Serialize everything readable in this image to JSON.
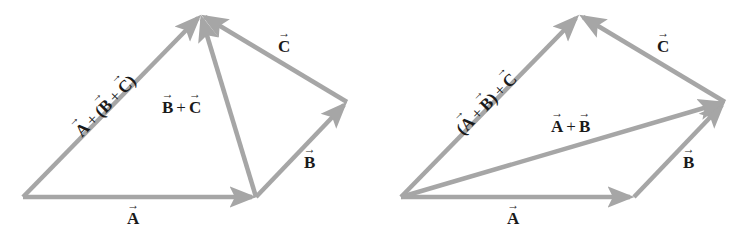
{
  "figure": {
    "left_panel": {
      "title": "A + (B + C)",
      "vectors": [
        {
          "id": "A",
          "from": [
            23,
            197
          ],
          "to": [
            256,
            197
          ]
        },
        {
          "id": "B",
          "from": [
            256,
            197
          ],
          "to": [
            347,
            102
          ]
        },
        {
          "id": "C",
          "from": [
            347,
            102
          ],
          "to": [
            201,
            15
          ]
        },
        {
          "id": "B+C",
          "from": [
            256,
            197
          ],
          "to": [
            201,
            15
          ]
        },
        {
          "id": "A+(B+C)",
          "from": [
            23,
            197
          ],
          "to": [
            201,
            15
          ]
        }
      ],
      "labels": {
        "A": "A",
        "B": "B",
        "C": "C",
        "bc_b": "B",
        "bc_plus": "+",
        "bc_c": "C",
        "sum_a": "A",
        "sum_plus1": "+",
        "sum_open": "(",
        "sum_b": "B",
        "sum_plus2": "+",
        "sum_c": "C",
        "sum_close": ")"
      }
    },
    "right_panel": {
      "title": "(A + B) + C",
      "vectors": [
        {
          "id": "A",
          "from": [
            401,
            197
          ],
          "to": [
            634,
            197
          ]
        },
        {
          "id": "B",
          "from": [
            634,
            197
          ],
          "to": [
            725,
            102
          ]
        },
        {
          "id": "C",
          "from": [
            725,
            102
          ],
          "to": [
            579,
            15
          ]
        },
        {
          "id": "A+B",
          "from": [
            401,
            197
          ],
          "to": [
            725,
            102
          ]
        },
        {
          "id": "(A+B)+C",
          "from": [
            401,
            197
          ],
          "to": [
            579,
            15
          ]
        }
      ],
      "labels": {
        "A": "A",
        "B": "B",
        "C": "C",
        "ab_a": "A",
        "ab_plus": "+",
        "ab_b": "B",
        "sum_open": "(",
        "sum_a": "A",
        "sum_plus1": "+",
        "sum_b": "B",
        "sum_close": ")",
        "sum_plus2": "+",
        "sum_c": "C"
      }
    },
    "colors": {
      "vector": "#a6a6a6",
      "text": "#1a1a1a",
      "background": "#ffffff"
    }
  }
}
